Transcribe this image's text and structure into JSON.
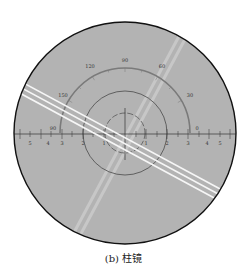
{
  "figure": {
    "caption": "(b) 柱镜",
    "colors": {
      "background": "#ffffff",
      "field": "#b3b3b3",
      "outline": "#111111",
      "protractor": "#707070",
      "reticle": "#4a4a4a",
      "bright_band": "#f4f4f4",
      "faint_band": "#cfcfcf"
    },
    "protractor": {
      "angle_labels": [
        "30",
        "60",
        "90",
        "120",
        "150"
      ]
    },
    "axis": {
      "left_labels": [
        "5",
        "4",
        "3",
        "2",
        "1"
      ],
      "right_labels": [
        "1",
        "2",
        "3",
        "4",
        "5"
      ],
      "marker_label_left": "90",
      "marker_label_right": "0"
    }
  }
}
